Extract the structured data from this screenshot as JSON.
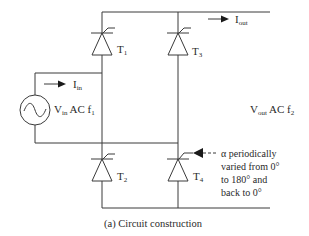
{
  "figure": {
    "caption": "(a) Circuit construction",
    "source": {
      "label_main": "V",
      "label_sub": "in",
      "label_rest": " AC f",
      "label_freq_sub": "1",
      "symbol": "sine-wave-ac-source"
    },
    "input_current": {
      "main": "I",
      "sub": "in"
    },
    "output_current": {
      "main": "I",
      "sub": "out"
    },
    "output_voltage": {
      "label_main": "V",
      "label_sub": "out",
      "label_rest": " AC f",
      "label_freq_sub": "2"
    },
    "thyristors": [
      {
        "id": "T1",
        "main": "T",
        "sub": "1"
      },
      {
        "id": "T2",
        "main": "T",
        "sub": "2"
      },
      {
        "id": "T3",
        "main": "T",
        "sub": "3"
      },
      {
        "id": "T4",
        "main": "T",
        "sub": "4"
      }
    ],
    "gate_annotation": {
      "line1": "α periodically",
      "line2": "varied from 0°",
      "line3": "to 180° and",
      "line4": "back to 0°"
    }
  }
}
